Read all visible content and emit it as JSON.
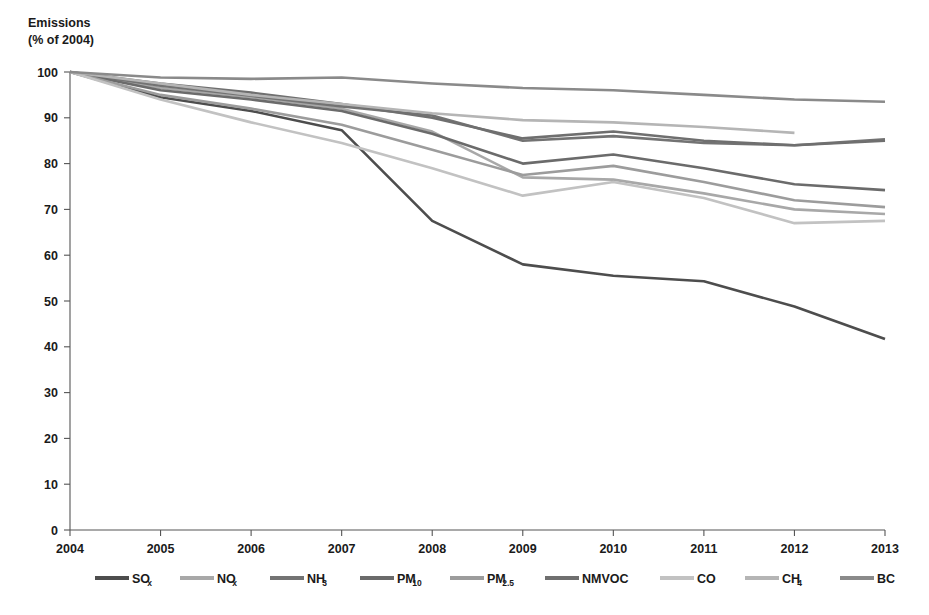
{
  "chart_data": {
    "type": "line",
    "title": "",
    "ylabel": "Emissions (% of 2004)",
    "ylabel_line1": "Emissions",
    "ylabel_line2": "(% of 2004)",
    "xlabel": "",
    "grid": false,
    "legend_position": "bottom",
    "x": [
      2004,
      2005,
      2006,
      2007,
      2008,
      2009,
      2010,
      2011,
      2012,
      2013
    ],
    "xtick_labels": [
      "2004",
      "2005",
      "2006",
      "2007",
      "2008",
      "2009",
      "2010",
      "2011",
      "2012",
      "2013"
    ],
    "ytick_labels": [
      "0",
      "10",
      "20",
      "30",
      "40",
      "50",
      "60",
      "70",
      "80",
      "90",
      "100"
    ],
    "yticks": [
      0,
      10,
      20,
      30,
      40,
      50,
      60,
      70,
      80,
      90,
      100
    ],
    "ylim": [
      0,
      100
    ],
    "xlim": [
      2004,
      2013
    ],
    "series": [
      {
        "name": "SOx",
        "label_main": "SO",
        "label_sub": "x",
        "color": "#4d4d4d",
        "values": [
          100,
          94.5,
          91.5,
          87.3,
          67.5,
          58.0,
          55.5,
          54.3,
          48.8,
          41.7
        ]
      },
      {
        "name": "NOx",
        "label_main": "NO",
        "label_sub": "x",
        "color": "#a8a8a8",
        "values": [
          100,
          96.5,
          94.5,
          92.0,
          87.0,
          77.0,
          76.5,
          73.5,
          70.0,
          69.0
        ]
      },
      {
        "name": "NH3",
        "label_main": "NH",
        "label_sub": "3",
        "color": "#737373",
        "values": [
          100,
          97.0,
          94.8,
          92.5,
          90.5,
          85.0,
          86.0,
          84.5,
          84.0,
          85.3
        ]
      },
      {
        "name": "PM10",
        "label_main": "PM",
        "label_sub": "10",
        "color": "#6b6b6b",
        "values": [
          100,
          96.0,
          94.0,
          91.5,
          86.5,
          80.0,
          82.0,
          79.0,
          75.5,
          74.2
        ]
      },
      {
        "name": "PM2.5",
        "label_main": "PM",
        "label_sub": "2.5",
        "color": "#9c9c9c",
        "values": [
          100,
          95.0,
          92.0,
          88.5,
          83.0,
          77.5,
          79.5,
          76.0,
          72.0,
          70.5
        ]
      },
      {
        "name": "NMVOC",
        "label_main": "NMVOC",
        "label_sub": "",
        "color": "#6f6f6f",
        "values": [
          100,
          97.5,
          95.5,
          93.0,
          90.0,
          85.5,
          87.0,
          85.0,
          84.0,
          85.0
        ]
      },
      {
        "name": "CO",
        "label_main": "CO",
        "label_sub": "",
        "color": "#c2c2c2",
        "values": [
          100,
          94.0,
          89.0,
          84.5,
          79.0,
          73.0,
          76.0,
          72.5,
          67.0,
          67.5
        ]
      },
      {
        "name": "CH4",
        "label_main": "CH",
        "label_sub": "4",
        "color": "#b5b5b5",
        "values": [
          100,
          97.5,
          95.0,
          93.0,
          91.0,
          89.5,
          89.0,
          88.0,
          86.7,
          null
        ]
      },
      {
        "name": "BC",
        "label_main": "BC",
        "label_sub": "",
        "color": "#8a8a8a",
        "values": [
          100,
          98.8,
          98.5,
          98.8,
          97.5,
          96.5,
          96.0,
          95.0,
          94.0,
          93.5
        ]
      }
    ]
  },
  "layout": {
    "plot_left": 70,
    "plot_right": 885,
    "plot_top": 72,
    "plot_bottom": 530,
    "legend_y": 578,
    "legend_items_x": [
      95,
      180,
      270,
      360,
      450,
      545,
      660,
      745,
      840
    ]
  }
}
